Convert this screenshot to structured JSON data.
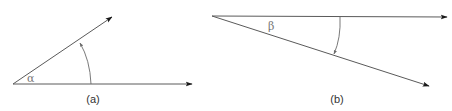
{
  "figure": {
    "panels": [
      {
        "id": "a",
        "caption": "(a)",
        "angle_symbol": "α",
        "origin": [
          13,
          84
        ],
        "ray_horizontal_end": [
          193,
          84
        ],
        "ray_inclined_end": [
          113,
          16
        ]
      },
      {
        "id": "b",
        "caption": "(b)",
        "angle_symbol": "β",
        "origin": [
          212,
          16
        ],
        "ray_horizontal_end": [
          448,
          17
        ],
        "ray_declined_end": [
          430,
          86
        ]
      }
    ],
    "colors": {
      "line": "#5a5a5a",
      "arrowhead": "#1a1a1a",
      "symbol": "#777777",
      "caption": "#333333"
    }
  }
}
